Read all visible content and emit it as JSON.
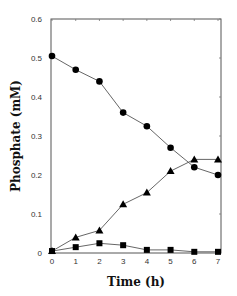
{
  "chart_data": {
    "type": "line",
    "title": "",
    "xlabel": "Time (h)",
    "ylabel": "Phosphate (mM)",
    "x": [
      0,
      1,
      2,
      3,
      4,
      5,
      6,
      7
    ],
    "xlim": [
      0,
      7
    ],
    "ylim": [
      0,
      0.6
    ],
    "xticks": [
      "0",
      "1",
      "2",
      "3",
      "4",
      "5",
      "6",
      "7"
    ],
    "yticks": [
      "0",
      "0.1",
      "0.2",
      "0.3",
      "0.4",
      "0.5",
      "0.6"
    ],
    "grid": false,
    "legend": null,
    "series": [
      {
        "name": "circles",
        "marker": "circle",
        "values": [
          0.505,
          0.47,
          0.44,
          0.36,
          0.325,
          0.27,
          0.22,
          0.2
        ]
      },
      {
        "name": "triangles",
        "marker": "triangle",
        "values": [
          0.005,
          0.04,
          0.058,
          0.125,
          0.155,
          0.21,
          0.24,
          0.24
        ]
      },
      {
        "name": "squares",
        "marker": "square",
        "values": [
          0.005,
          0.015,
          0.025,
          0.02,
          0.008,
          0.008,
          0.003,
          0.003
        ]
      }
    ]
  }
}
